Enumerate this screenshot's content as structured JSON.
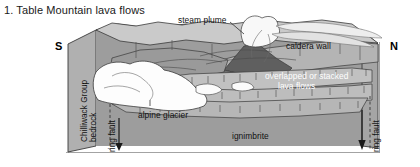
{
  "figure": {
    "title": "1. Table Mountain lava flows",
    "caption_number": "1."
  },
  "compass": {
    "south": "S",
    "north": "N"
  },
  "labels": {
    "steam_plume": "steam plume",
    "caldera_wall": "caldera wall",
    "overlapped_line1": "overlapped or stacked",
    "overlapped_line2": "lava flows",
    "alpine_glacier": "alpine glacier",
    "ignimbrite": "ignimbrite",
    "ring_fault_left": "ring fault",
    "ring_fault_right": "ring fault",
    "bedrock_line1": "Chilliwack Group",
    "bedrock_line2": "bedrock"
  },
  "colors": {
    "background": "#ffffff",
    "outline": "#3a3a3a",
    "bedrock_face": "#b9b9b9",
    "bedrock_side": "#a8a8a8",
    "ignimbrite": "#949494",
    "upper_surface": "#c9c9c9",
    "lava_light": "#bdbdbd",
    "lava_mid": "#8e8e8e",
    "volcano_dark": "#5e5e5e",
    "glacier_white": "#fdfdfd",
    "plume_white": "#f4f4f4",
    "text_dark": "#111111",
    "text_light": "#ffffff"
  },
  "geology": {
    "units": [
      {
        "name": "Chilliwack Group bedrock",
        "tone": "mid-grey",
        "position": "basement / left block face"
      },
      {
        "name": "ignimbrite",
        "tone": "dark grey",
        "position": "lower caldera fill"
      },
      {
        "name": "overlapped or stacked lava flows",
        "tone": "light grey banded",
        "position": "middle fill"
      },
      {
        "name": "caldera wall",
        "tone": "grey slope",
        "position": "north flank"
      },
      {
        "name": "alpine glacier",
        "tone": "white",
        "position": "south valley"
      },
      {
        "name": "steam plume",
        "tone": "white",
        "position": "above vent"
      }
    ],
    "structures": [
      {
        "name": "ring fault",
        "sense": "down-dropped",
        "side": "south"
      },
      {
        "name": "ring fault",
        "sense": "down-dropped",
        "side": "north"
      }
    ]
  }
}
